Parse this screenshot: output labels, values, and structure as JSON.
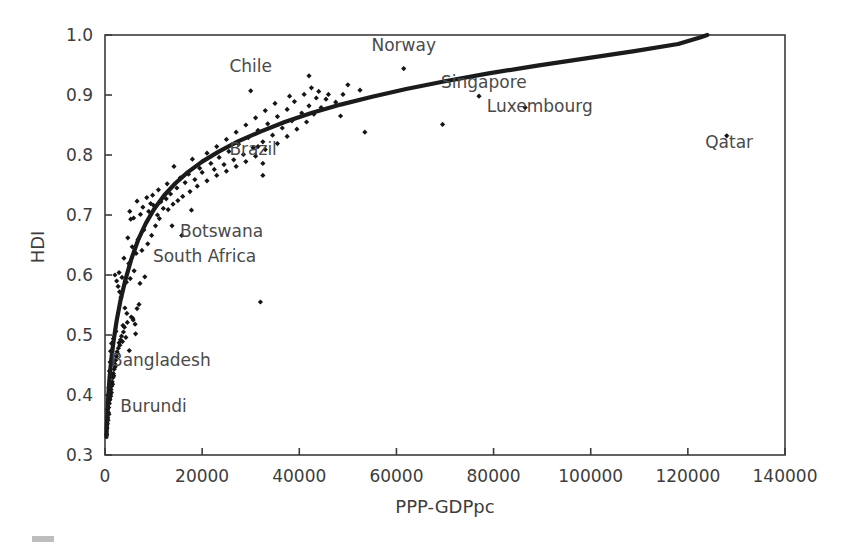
{
  "figure": {
    "background": "#ffffff",
    "ink_color": "#2e2e2e",
    "marker_color": "#151515",
    "curve_color": "#1b1b1b",
    "corner_mark": {
      "name": "corner-smudge",
      "color": "#bdbdbd"
    }
  },
  "chart_data": {
    "type": "scatter",
    "title": "",
    "xlabel": "PPP-GDPpc",
    "ylabel": "HDI",
    "xlim": [
      0,
      140000
    ],
    "ylim": [
      0.3,
      1.0
    ],
    "xticks": [
      0,
      20000,
      40000,
      60000,
      80000,
      100000,
      120000,
      140000
    ],
    "xticklabels": [
      "0",
      "20000",
      "40000",
      "60000",
      "80000",
      "100000",
      "120000",
      "140000"
    ],
    "yticks": [
      0.3,
      0.4,
      0.5,
      0.6,
      0.7,
      0.8,
      0.9,
      1.0
    ],
    "yticklabels": [
      "0.3",
      "0.4",
      "0.5",
      "0.6",
      "0.7",
      "0.8",
      "0.9",
      "1.0"
    ],
    "grid": false,
    "legend": null,
    "annotations": [
      {
        "text": "Chile",
        "x": 30000,
        "y": 0.938
      },
      {
        "text": "Norway",
        "x": 61500,
        "y": 0.973
      },
      {
        "text": "Singapore",
        "x": 78000,
        "y": 0.911
      },
      {
        "text": "Luxembourg",
        "x": 89500,
        "y": 0.872
      },
      {
        "text": "Qatar",
        "x": 128500,
        "y": 0.812
      },
      {
        "text": "Brazil",
        "x": 30500,
        "y": 0.8
      },
      {
        "text": "Botswana",
        "x": 24000,
        "y": 0.663
      },
      {
        "text": "South Africa",
        "x": 20500,
        "y": 0.622
      },
      {
        "text": "Bangladesh",
        "x": 11500,
        "y": 0.448
      },
      {
        "text": "Burundi",
        "x": 10000,
        "y": 0.372
      }
    ],
    "fit_curve": {
      "name": "logarithmic-fit",
      "description": "Log fit of HDI against PPP-GDPpc rising steeply at low income and saturating near 1.0",
      "points": [
        [
          300,
          0.33
        ],
        [
          600,
          0.388
        ],
        [
          900,
          0.425
        ],
        [
          1300,
          0.46
        ],
        [
          1800,
          0.492
        ],
        [
          2400,
          0.524
        ],
        [
          3200,
          0.558
        ],
        [
          4200,
          0.592
        ],
        [
          5400,
          0.626
        ],
        [
          6800,
          0.658
        ],
        [
          8400,
          0.686
        ],
        [
          10200,
          0.711
        ],
        [
          12200,
          0.733
        ],
        [
          14500,
          0.753
        ],
        [
          17000,
          0.771
        ],
        [
          20000,
          0.789
        ],
        [
          23500,
          0.806
        ],
        [
          27500,
          0.823
        ],
        [
          32000,
          0.839
        ],
        [
          37000,
          0.855
        ],
        [
          42500,
          0.87
        ],
        [
          48500,
          0.884
        ],
        [
          55000,
          0.897
        ],
        [
          62000,
          0.91
        ],
        [
          70000,
          0.923
        ],
        [
          79000,
          0.936
        ],
        [
          89000,
          0.949
        ],
        [
          99000,
          0.961
        ],
        [
          109000,
          0.973
        ],
        [
          118000,
          0.985
        ],
        [
          122500,
          0.996
        ],
        [
          124000,
          1.0
        ]
      ]
    },
    "series": [
      {
        "name": "countries",
        "marker": "diamond",
        "points": [
          [
            350,
            0.334
          ],
          [
            420,
            0.345
          ],
          [
            500,
            0.352
          ],
          [
            560,
            0.362
          ],
          [
            620,
            0.358
          ],
          [
            700,
            0.371
          ],
          [
            760,
            0.379
          ],
          [
            820,
            0.368
          ],
          [
            900,
            0.386
          ],
          [
            950,
            0.394
          ],
          [
            1020,
            0.392
          ],
          [
            1100,
            0.401
          ],
          [
            1180,
            0.398
          ],
          [
            1250,
            0.409
          ],
          [
            1320,
            0.404
          ],
          [
            1400,
            0.415
          ],
          [
            1480,
            0.422
          ],
          [
            1560,
            0.418
          ],
          [
            1640,
            0.429
          ],
          [
            1720,
            0.436
          ],
          [
            1800,
            0.432
          ],
          [
            1900,
            0.443
          ],
          [
            2000,
            0.452
          ],
          [
            2100,
            0.447
          ],
          [
            2200,
            0.458
          ],
          [
            2350,
            0.464
          ],
          [
            2480,
            0.472
          ],
          [
            2600,
            0.469
          ],
          [
            2750,
            0.478
          ],
          [
            2900,
            0.487
          ],
          [
            3050,
            0.483
          ],
          [
            3200,
            0.492
          ],
          [
            3400,
            0.498
          ],
          [
            3600,
            0.489
          ],
          [
            3800,
            0.505
          ],
          [
            4000,
            0.513
          ],
          [
            4300,
            0.496
          ],
          [
            4600,
            0.521
          ],
          [
            5000,
            0.474
          ],
          [
            5400,
            0.53
          ],
          [
            5800,
            0.525
          ],
          [
            6200,
            0.518
          ],
          [
            6600,
            0.544
          ],
          [
            7000,
            0.551
          ],
          [
            3300,
            0.563
          ],
          [
            3000,
            0.572
          ],
          [
            2700,
            0.581
          ],
          [
            2400,
            0.59
          ],
          [
            2050,
            0.6
          ],
          [
            2900,
            0.604
          ],
          [
            3500,
            0.596
          ],
          [
            4400,
            0.588
          ],
          [
            5200,
            0.594
          ],
          [
            6000,
            0.607
          ],
          [
            7200,
            0.586
          ],
          [
            8200,
            0.597
          ],
          [
            4900,
            0.619
          ],
          [
            3900,
            0.628
          ],
          [
            6400,
            0.636
          ],
          [
            5600,
            0.647
          ],
          [
            7600,
            0.641
          ],
          [
            8800,
            0.652
          ],
          [
            4700,
            0.662
          ],
          [
            6800,
            0.659
          ],
          [
            9600,
            0.666
          ],
          [
            8000,
            0.675
          ],
          [
            10400,
            0.682
          ],
          [
            5900,
            0.695
          ],
          [
            7300,
            0.701
          ],
          [
            11200,
            0.694
          ],
          [
            9000,
            0.706
          ],
          [
            12000,
            0.711
          ],
          [
            10000,
            0.716
          ],
          [
            13000,
            0.709
          ],
          [
            11500,
            0.722
          ],
          [
            14000,
            0.718
          ],
          [
            12600,
            0.727
          ],
          [
            15000,
            0.724
          ],
          [
            9800,
            0.733
          ],
          [
            13500,
            0.735
          ],
          [
            16000,
            0.731
          ],
          [
            11000,
            0.742
          ],
          [
            14800,
            0.745
          ],
          [
            17500,
            0.739
          ],
          [
            12800,
            0.752
          ],
          [
            16500,
            0.754
          ],
          [
            19000,
            0.748
          ],
          [
            15500,
            0.762
          ],
          [
            18500,
            0.759
          ],
          [
            21000,
            0.757
          ],
          [
            17200,
            0.768
          ],
          [
            20000,
            0.771
          ],
          [
            23000,
            0.766
          ],
          [
            19500,
            0.778
          ],
          [
            22500,
            0.776
          ],
          [
            25000,
            0.773
          ],
          [
            14200,
            0.781
          ],
          [
            21800,
            0.786
          ],
          [
            24500,
            0.784
          ],
          [
            27000,
            0.781
          ],
          [
            18000,
            0.793
          ],
          [
            23500,
            0.796
          ],
          [
            26500,
            0.792
          ],
          [
            29000,
            0.789
          ],
          [
            21000,
            0.803
          ],
          [
            25500,
            0.806
          ],
          [
            28500,
            0.801
          ],
          [
            31000,
            0.798
          ],
          [
            23000,
            0.814
          ],
          [
            27500,
            0.818
          ],
          [
            30500,
            0.812
          ],
          [
            33000,
            0.809
          ],
          [
            25000,
            0.826
          ],
          [
            29500,
            0.829
          ],
          [
            32500,
            0.822
          ],
          [
            35500,
            0.819
          ],
          [
            27000,
            0.838
          ],
          [
            31500,
            0.841
          ],
          [
            34500,
            0.833
          ],
          [
            37500,
            0.831
          ],
          [
            29000,
            0.85
          ],
          [
            33500,
            0.852
          ],
          [
            36500,
            0.845
          ],
          [
            39500,
            0.843
          ],
          [
            31000,
            0.862
          ],
          [
            35500,
            0.864
          ],
          [
            38500,
            0.857
          ],
          [
            41500,
            0.855
          ],
          [
            33000,
            0.874
          ],
          [
            37500,
            0.876
          ],
          [
            40500,
            0.87
          ],
          [
            43000,
            0.868
          ],
          [
            35000,
            0.886
          ],
          [
            39000,
            0.889
          ],
          [
            42000,
            0.882
          ],
          [
            44500,
            0.879
          ],
          [
            30000,
            0.907
          ],
          [
            38000,
            0.898
          ],
          [
            41000,
            0.901
          ],
          [
            43500,
            0.895
          ],
          [
            45500,
            0.893
          ],
          [
            42500,
            0.912
          ],
          [
            44000,
            0.906
          ],
          [
            46000,
            0.901
          ],
          [
            42000,
            0.932
          ],
          [
            50000,
            0.917
          ],
          [
            52500,
            0.908
          ],
          [
            47500,
            0.888
          ],
          [
            49000,
            0.901
          ],
          [
            53500,
            0.838
          ],
          [
            48500,
            0.865
          ],
          [
            32500,
            0.786
          ],
          [
            32500,
            0.766
          ],
          [
            31500,
            0.814
          ],
          [
            32000,
            0.555
          ],
          [
            61500,
            0.944
          ],
          [
            69500,
            0.851
          ],
          [
            77000,
            0.898
          ],
          [
            86500,
            0.879
          ],
          [
            128000,
            0.832
          ],
          [
            5100,
            0.706
          ],
          [
            5300,
            0.693
          ],
          [
            7800,
            0.713
          ],
          [
            6600,
            0.723
          ],
          [
            8600,
            0.729
          ],
          [
            9400,
            0.719
          ],
          [
            10800,
            0.7
          ],
          [
            13800,
            0.682
          ],
          [
            15800,
            0.666
          ],
          [
            17800,
            0.708
          ],
          [
            4100,
            0.545
          ],
          [
            4500,
            0.536
          ],
          [
            5700,
            0.528
          ],
          [
            6300,
            0.502
          ],
          [
            3700,
            0.516
          ],
          [
            1150,
            0.473
          ],
          [
            1350,
            0.486
          ],
          [
            1550,
            0.466
          ],
          [
            1750,
            0.494
          ],
          [
            2250,
            0.506
          ],
          [
            900,
            0.44
          ],
          [
            1050,
            0.455
          ],
          [
            780,
            0.412
          ],
          [
            650,
            0.4
          ],
          [
            480,
            0.376
          ]
        ]
      }
    ]
  }
}
